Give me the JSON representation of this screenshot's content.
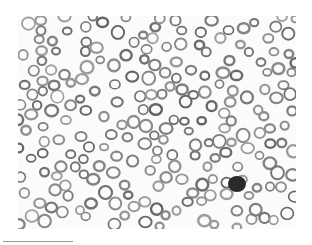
{
  "image": {
    "subject": "blood smear micrograph",
    "description": "Grayscale microscopy of red blood cells with one dark nucleated cell",
    "background_color": "#fbfbfb",
    "cell_ring_color": "#8a8a8a",
    "nucleus_color": "#2a2a2a"
  }
}
